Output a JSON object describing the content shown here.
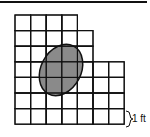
{
  "diagram": {
    "type": "grid-area-figure",
    "scale_label": "1 ft",
    "colors": {
      "grid_line": "#111111",
      "shape_fill": "#8a8a8a",
      "shape_stroke": "#111111"
    },
    "grid": {
      "cell_size_px": 15.6,
      "rows": [
        {
          "row": 1,
          "columns": 4
        },
        {
          "row": 2,
          "columns": 5
        },
        {
          "row": 3,
          "columns": 5
        },
        {
          "row": 4,
          "columns": 7
        },
        {
          "row": 5,
          "columns": 7
        },
        {
          "row": 6,
          "columns": 7
        },
        {
          "row": 7,
          "columns": 7
        }
      ]
    },
    "shaded_shape": {
      "kind": "tilted-ellipse"
    }
  }
}
